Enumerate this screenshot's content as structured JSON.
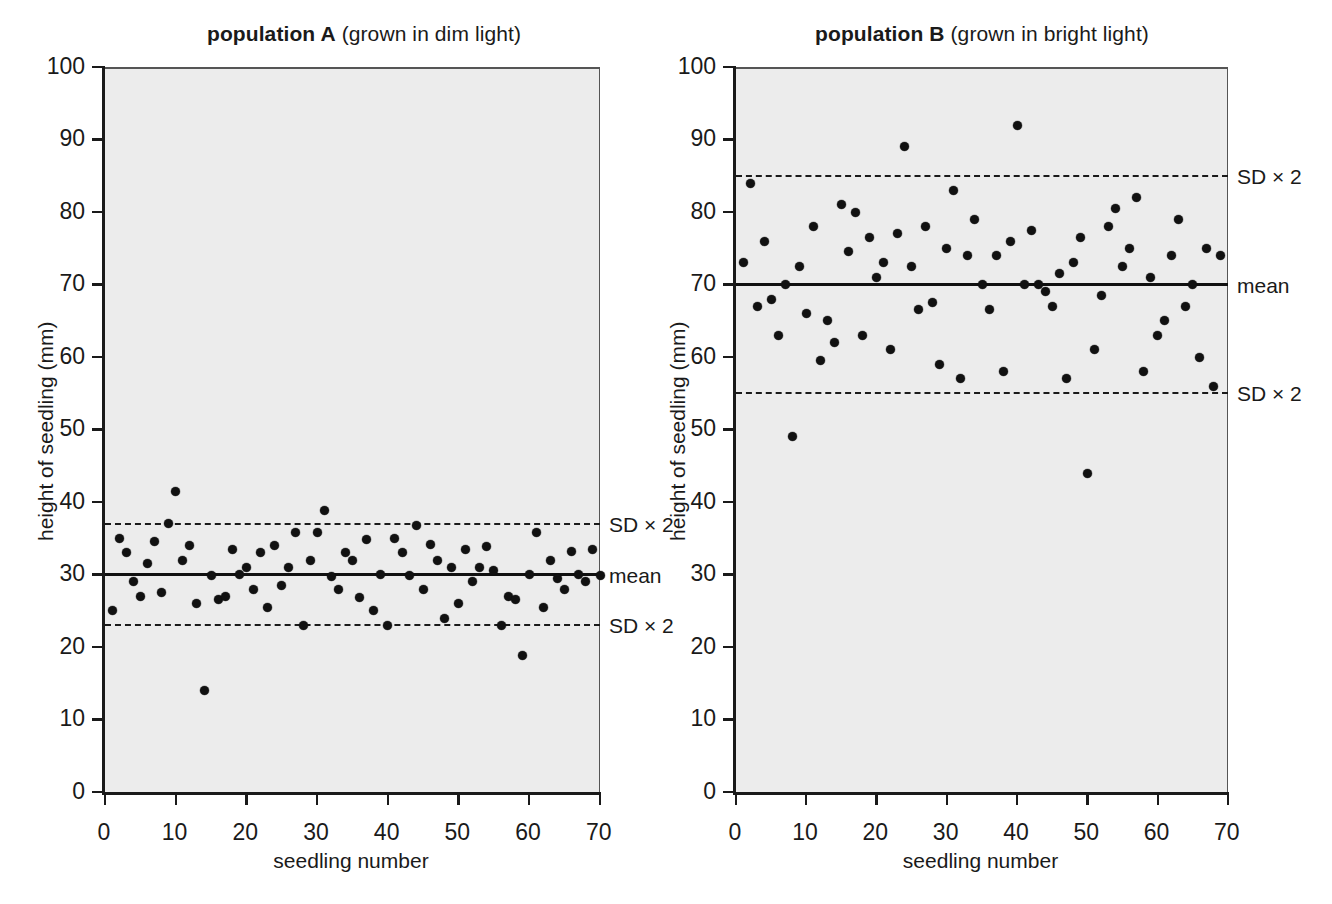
{
  "figure": {
    "background_color": "#ffffff",
    "plot_area_color": "#ececec",
    "marker_color": "#111111"
  },
  "chart_data": [
    {
      "type": "scatter",
      "panel": "A",
      "title_bold": "population A",
      "title_rest": " (grown in dim light)",
      "xlabel": "seedling number",
      "ylabel": "height of seedling (mm)",
      "xlim": [
        0,
        70
      ],
      "ylim": [
        0,
        100
      ],
      "xticks": [
        0,
        10,
        20,
        30,
        40,
        50,
        60,
        70
      ],
      "yticks": [
        0,
        10,
        20,
        30,
        40,
        50,
        60,
        70,
        80,
        90,
        100
      ],
      "grid": false,
      "annotations": [
        {
          "label": "SD × 2",
          "y": 37,
          "style": "dashed"
        },
        {
          "label": "mean",
          "y": 30,
          "style": "solid"
        },
        {
          "label": "SD × 2",
          "y": 23,
          "style": "dashed"
        }
      ],
      "mean": 30,
      "sd2_upper": 37,
      "sd2_lower": 23,
      "x": [
        1,
        2,
        3,
        4,
        5,
        6,
        7,
        8,
        9,
        10,
        11,
        12,
        13,
        14,
        15,
        16,
        17,
        18,
        19,
        20,
        21,
        22,
        23,
        24,
        25,
        26,
        27,
        28,
        29,
        30,
        31,
        32,
        33,
        34,
        35,
        36,
        37,
        38,
        39,
        40,
        41,
        42,
        43,
        44,
        45,
        46,
        47,
        48,
        49,
        50,
        51,
        52,
        53,
        54,
        55,
        56,
        57,
        58,
        59,
        60,
        61,
        62,
        63,
        64,
        65,
        66,
        67,
        68,
        69,
        70
      ],
      "y": [
        25,
        35,
        33,
        29,
        27,
        31.5,
        34.5,
        27.5,
        37,
        41.5,
        32,
        34,
        26,
        14,
        29.8,
        26.5,
        27,
        33.5,
        30,
        31,
        28,
        33,
        25.5,
        34,
        28.5,
        31,
        35.8,
        23,
        32,
        35.8,
        38.8,
        29.7,
        28,
        33,
        32,
        26.8,
        34.8,
        25,
        30,
        23,
        35,
        33,
        29.8,
        36.8,
        28,
        34.2,
        32,
        24,
        31,
        26,
        33.5,
        29,
        31,
        33.8,
        30.5,
        23,
        27,
        26.5,
        18.8,
        30,
        35.8,
        25.5,
        32,
        29.5,
        28,
        33.2,
        30,
        29,
        33.5,
        29.8
      ]
    },
    {
      "type": "scatter",
      "panel": "B",
      "title_bold": "population B",
      "title_rest": " (grown in bright light)",
      "xlabel": "seedling number",
      "ylabel": "height of seedling (mm)",
      "xlim": [
        0,
        70
      ],
      "ylim": [
        0,
        100
      ],
      "xticks": [
        0,
        10,
        20,
        30,
        40,
        50,
        60,
        70
      ],
      "yticks": [
        0,
        10,
        20,
        30,
        40,
        50,
        60,
        70,
        80,
        90,
        100
      ],
      "grid": false,
      "annotations": [
        {
          "label": "SD × 2",
          "y": 85,
          "style": "dashed"
        },
        {
          "label": "mean",
          "y": 70,
          "style": "solid"
        },
        {
          "label": "SD × 2",
          "y": 55,
          "style": "dashed"
        }
      ],
      "mean": 70,
      "sd2_upper": 85,
      "sd2_lower": 55,
      "x": [
        1,
        2,
        3,
        4,
        5,
        6,
        7,
        8,
        9,
        10,
        11,
        12,
        13,
        14,
        15,
        16,
        17,
        18,
        19,
        20,
        21,
        22,
        23,
        24,
        25,
        26,
        27,
        28,
        29,
        30,
        31,
        32,
        33,
        34,
        35,
        36,
        37,
        38,
        39,
        40,
        41,
        42,
        43,
        44,
        45,
        46,
        47,
        48,
        49,
        50,
        51,
        52,
        53,
        54,
        55,
        56,
        57,
        58,
        59,
        60,
        61,
        62,
        63,
        64,
        65,
        66,
        67,
        68,
        69
      ],
      "y": [
        73,
        84,
        67,
        76,
        68,
        63,
        70,
        49,
        72.5,
        66,
        78,
        59.5,
        65,
        62,
        81,
        74.5,
        80,
        63,
        76.5,
        71,
        73,
        61,
        77,
        89,
        72.5,
        66.5,
        78,
        67.5,
        59,
        75,
        83,
        57,
        74,
        79,
        70,
        66.5,
        74,
        58,
        76,
        92,
        70,
        77.5,
        70,
        69,
        67,
        71.5,
        57,
        73,
        76.5,
        44,
        61,
        68.5,
        78,
        80.5,
        72.5,
        75,
        82,
        58,
        71,
        63,
        65,
        74,
        79,
        67,
        70,
        60,
        75,
        56,
        74
      ]
    }
  ]
}
